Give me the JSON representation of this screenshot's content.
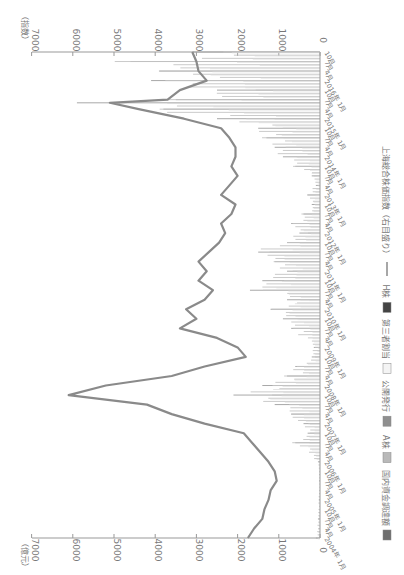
{
  "chart_data": {
    "type": "bar",
    "orientation": "rotated-90-clockwise",
    "title": "",
    "left_axis": {
      "label": "（億元）",
      "ticks": [
        0,
        1000,
        2000,
        3000,
        4000,
        5000,
        6000,
        7000
      ],
      "ylim": [
        0,
        7000
      ]
    },
    "right_axis": {
      "label": "（指数）",
      "ticks": [
        0,
        1000,
        2000,
        3000,
        4000,
        5000,
        6000,
        7000
      ],
      "ylim": [
        0,
        7000
      ]
    },
    "x_range": {
      "start": "2004年1月",
      "end": "2016年10月"
    },
    "x_tick_years": [
      "2004年",
      "2005年",
      "2006年",
      "2007年",
      "2008年",
      "2009年",
      "2010年",
      "2011年",
      "2012年",
      "2013年",
      "2014年",
      "2015年",
      "2016年"
    ],
    "x_tick_months": [
      "1月",
      "4月",
      "7月",
      "10月"
    ],
    "legend": [
      {
        "label": "国内資金調達額",
        "color": "#6e6e6e",
        "kind": "bar"
      },
      {
        "label": "A株",
        "color": "#b9b9b9",
        "kind": "bar"
      },
      {
        "label": "公開発行",
        "color": "#8f8f8f",
        "kind": "bar"
      },
      {
        "label": "第三者割当",
        "color": "#f4f4f4",
        "kind": "bar"
      },
      {
        "label": "H株",
        "color": "#444444",
        "kind": "bar"
      },
      {
        "label": "上海総合株価指数（右目盛り）",
        "color": "#8a8a8a",
        "kind": "line"
      }
    ],
    "series": [
      {
        "name": "上海総合株価指数（右目盛り）",
        "axis": "right",
        "x": [
          "2004-01",
          "2004-04",
          "2004-07",
          "2004-10",
          "2005-01",
          "2005-04",
          "2005-07",
          "2005-10",
          "2006-01",
          "2006-04",
          "2006-07",
          "2006-10",
          "2007-01",
          "2007-04",
          "2007-07",
          "2007-10",
          "2008-01",
          "2008-04",
          "2008-07",
          "2008-10",
          "2009-01",
          "2009-04",
          "2009-07",
          "2009-10",
          "2010-01",
          "2010-04",
          "2010-07",
          "2010-10",
          "2011-01",
          "2011-04",
          "2011-07",
          "2011-10",
          "2012-01",
          "2012-04",
          "2012-07",
          "2012-10",
          "2013-01",
          "2013-04",
          "2013-07",
          "2013-10",
          "2014-01",
          "2014-04",
          "2014-07",
          "2014-10",
          "2015-01",
          "2015-04",
          "2015-06",
          "2015-07",
          "2015-10",
          "2016-01",
          "2016-04",
          "2016-07",
          "2016-10"
        ],
        "values": [
          1750,
          1600,
          1400,
          1350,
          1250,
          1200,
          1050,
          1100,
          1250,
          1450,
          1650,
          1850,
          2800,
          3600,
          4200,
          6100,
          5200,
          3600,
          2800,
          1800,
          2000,
          2500,
          3400,
          3000,
          3250,
          2800,
          2600,
          2950,
          2750,
          2950,
          2700,
          2450,
          2300,
          2400,
          2150,
          2050,
          2400,
          2200,
          2000,
          2150,
          2050,
          2050,
          2200,
          2400,
          3300,
          4400,
          5100,
          3700,
          3400,
          2750,
          2950,
          3000,
          3100
        ]
      },
      {
        "name": "国内資金調達額",
        "axis": "left",
        "note": "monthly bars, approximate",
        "x": [
          "2004-01",
          "2004-07",
          "2005-01",
          "2005-07",
          "2006-01",
          "2006-07",
          "2006-10",
          "2007-01",
          "2007-04",
          "2007-07",
          "2007-10",
          "2008-01",
          "2008-04",
          "2008-07",
          "2008-10",
          "2009-01",
          "2009-07",
          "2009-10",
          "2010-01",
          "2010-04",
          "2010-07",
          "2010-10",
          "2011-01",
          "2011-04",
          "2011-07",
          "2011-10",
          "2012-01",
          "2012-04",
          "2012-07",
          "2012-10",
          "2013-01",
          "2013-04",
          "2013-07",
          "2013-10",
          "2014-01",
          "2014-04",
          "2014-07",
          "2014-10",
          "2015-01",
          "2015-04",
          "2015-06",
          "2015-07",
          "2015-10",
          "2016-01",
          "2016-04",
          "2016-07",
          "2016-10"
        ],
        "values": [
          100,
          50,
          30,
          20,
          50,
          600,
          300,
          400,
          700,
          1100,
          2100,
          1400,
          800,
          600,
          200,
          150,
          700,
          900,
          1200,
          800,
          1700,
          1400,
          800,
          1100,
          1500,
          800,
          500,
          700,
          400,
          200,
          300,
          100,
          200,
          600,
          900,
          1100,
          1300,
          1500,
          2500,
          3800,
          5900,
          3500,
          2500,
          4100,
          3900,
          4600,
          3100
        ]
      }
    ]
  }
}
